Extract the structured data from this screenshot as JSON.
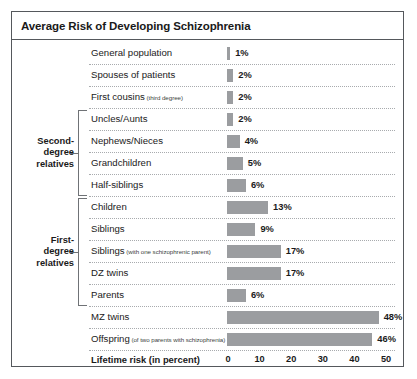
{
  "chart_title": "Average Risk of Developing Schizophrenia",
  "chart_data": {
    "type": "bar",
    "title": "Average Risk of Developing Schizophrenia",
    "xlabel": "Lifetime risk (in percent)",
    "ylabel": "",
    "orientation": "horizontal",
    "xlim": [
      0,
      50
    ],
    "xticks": [
      0,
      10,
      20,
      30,
      40,
      50
    ],
    "xtick_labels": [
      "0",
      "10",
      "20",
      "30",
      "40",
      "50"
    ],
    "grid": false,
    "legend": "none",
    "value_suffix": "%",
    "categories": [
      "General population",
      "Spouses of patients",
      "First cousins (third degree)",
      "Uncles/Aunts",
      "Nephews/Nieces",
      "Grandchildren",
      "Half-siblings",
      "Children",
      "Siblings",
      "Siblings (with one schizophrenic parent)",
      "DZ twins",
      "Parents",
      "MZ twins",
      "Offspring (of two parents with schizophrenia)"
    ],
    "values": [
      1,
      2,
      2,
      2,
      4,
      5,
      6,
      13,
      9,
      17,
      17,
      6,
      48,
      46
    ]
  },
  "groups": [
    {
      "label": "Second-\ndegree\nrelatives",
      "first_row": 3,
      "last_row": 6
    },
    {
      "label": "First-\ndegree\nrelatives",
      "first_row": 7,
      "last_row": 11
    }
  ],
  "rows": [
    {
      "label": "General population",
      "sub": "",
      "value": 1,
      "value_label": "1%"
    },
    {
      "label": "Spouses of patients",
      "sub": "",
      "value": 2,
      "value_label": "2%"
    },
    {
      "label": "First cousins",
      "sub": "(third degree)",
      "value": 2,
      "value_label": "2%"
    },
    {
      "label": "Uncles/Aunts",
      "sub": "",
      "value": 2,
      "value_label": "2%"
    },
    {
      "label": "Nephews/Nieces",
      "sub": "",
      "value": 4,
      "value_label": "4%"
    },
    {
      "label": "Grandchildren",
      "sub": "",
      "value": 5,
      "value_label": "5%"
    },
    {
      "label": "Half-siblings",
      "sub": "",
      "value": 6,
      "value_label": "6%"
    },
    {
      "label": "Children",
      "sub": "",
      "value": 13,
      "value_label": "13%"
    },
    {
      "label": "Siblings",
      "sub": "",
      "value": 9,
      "value_label": "9%"
    },
    {
      "label": "Siblings",
      "sub": "(with one schizophrenic parent)",
      "value": 17,
      "value_label": "17%"
    },
    {
      "label": "DZ twins",
      "sub": "",
      "value": 17,
      "value_label": "17%"
    },
    {
      "label": "Parents",
      "sub": "",
      "value": 6,
      "value_label": "6%"
    },
    {
      "label": "MZ twins",
      "sub": "",
      "value": 48,
      "value_label": "48%"
    },
    {
      "label": "Offspring",
      "sub": "(of two parents with schizophrenia)",
      "value": 46,
      "value_label": "46%"
    }
  ],
  "axis": {
    "title": "Lifetime risk (in percent)",
    "ticks": [
      "0",
      "10",
      "20",
      "30",
      "40",
      "50"
    ]
  },
  "colors": {
    "bar": "#9b9da0",
    "frame": "#55585c",
    "separator": "#a8abae",
    "text": "#1a1a1a",
    "background": "#ffffff"
  }
}
